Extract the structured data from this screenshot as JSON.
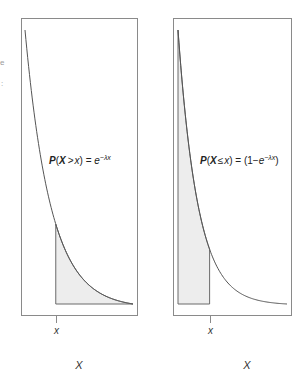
{
  "chart_data": [
    {
      "type": "area",
      "title": "",
      "annotation": {
        "prefix": "P",
        "var": "X",
        "op": ">",
        "arg": "x",
        "rhs": "e",
        "exponent": "−λx",
        "full": "P(X > x) = e^{−λx}"
      },
      "xlabel": "X",
      "ylabel": "",
      "tick_labels": [
        "x"
      ],
      "curve": {
        "function": "exponential_density",
        "lambda": 4.2,
        "x_range": [
          0,
          1
        ]
      },
      "shaded_region": {
        "from": 0.285,
        "to": 1,
        "meaning": "upper tail"
      },
      "grid": false
    },
    {
      "type": "area",
      "title": "",
      "annotation": {
        "prefix": "P",
        "var": "X",
        "op": "≤",
        "arg": "x",
        "rhs_open": "(1−",
        "rhs": "e",
        "exponent": "−λx",
        "rhs_close": ")",
        "full": "P(X ≤ x) = (1−e^{−λx})"
      },
      "xlabel": "X",
      "ylabel": "",
      "tick_labels": [
        "x"
      ],
      "curve": {
        "function": "exponential_density",
        "lambda": 5.5,
        "x_range": [
          0,
          1
        ]
      },
      "shaded_region": {
        "from": 0,
        "to": 0.29,
        "meaning": "lower region"
      },
      "grid": false
    }
  ],
  "edge_fragments": [
    "e",
    ":"
  ],
  "colors": {
    "frame": "#8a8a8a",
    "curve": "#555555",
    "shade": "#ededed"
  }
}
